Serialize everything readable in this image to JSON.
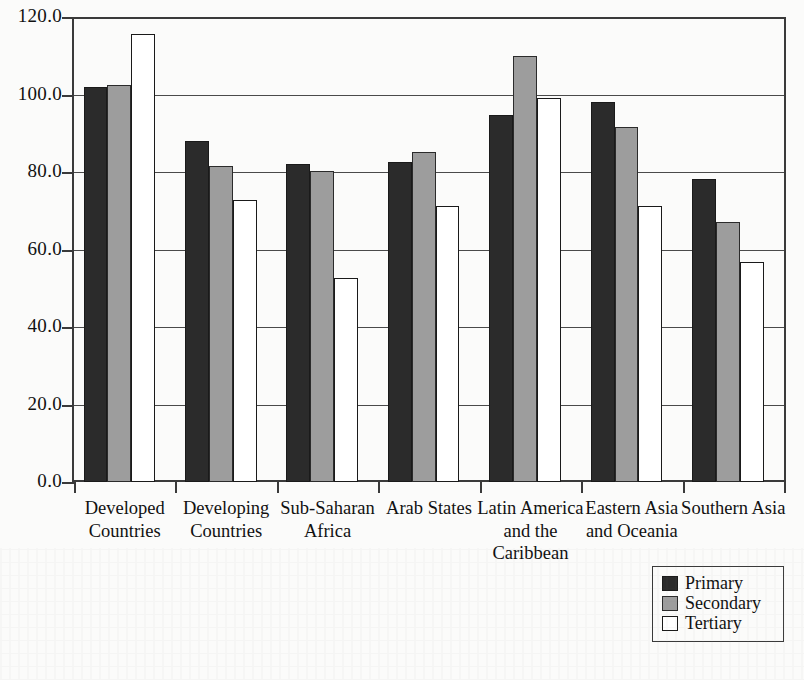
{
  "chart_data": {
    "type": "bar",
    "title": "",
    "subtitle": "",
    "xlabel": "",
    "ylabel": "",
    "ylim": [
      0.0,
      120.0
    ],
    "grid": true,
    "legend_position": "bottom-right",
    "y_ticks": [
      "0.0",
      "20.0",
      "40.0",
      "60.0",
      "80.0",
      "100.0",
      "120.0"
    ],
    "y_tick_values": [
      0.0,
      20.0,
      40.0,
      60.0,
      80.0,
      100.0,
      120.0
    ],
    "categories": [
      "Developed\nCountries",
      "Developing\nCountries",
      "Sub-Saharan\nAfrica",
      "Arab States",
      "Latin America\nand the\nCaribbean",
      "Eastern Asia\nand Oceania",
      "Southern Asia"
    ],
    "category_lines": [
      [
        "Developed",
        "Countries"
      ],
      [
        "Developing",
        "Countries"
      ],
      [
        "Sub-Saharan",
        "Africa"
      ],
      [
        "Arab States"
      ],
      [
        "Latin America",
        "and the",
        "Caribbean"
      ],
      [
        "Eastern Asia",
        "and Oceania"
      ],
      [
        "Southern Asia"
      ]
    ],
    "series": [
      {
        "name": "Primary",
        "color": "#2b2b2b",
        "values": [
          102.5,
          88.5,
          82.5,
          83.0,
          95.0,
          98.5,
          78.5
        ]
      },
      {
        "name": "Secondary",
        "color": "#9d9d9d",
        "values": [
          103.0,
          82.0,
          80.5,
          85.5,
          110.5,
          92.0,
          67.5
        ]
      },
      {
        "name": "Tertiary",
        "color": "#ffffff",
        "values": [
          116.0,
          73.0,
          53.0,
          71.5,
          99.5,
          71.5,
          57.0
        ]
      }
    ]
  },
  "legend": {
    "items": [
      {
        "label": "Primary",
        "swatch": "primary"
      },
      {
        "label": "Secondary",
        "swatch": "secondary"
      },
      {
        "label": "Tertiary",
        "swatch": "tertiary"
      }
    ]
  }
}
